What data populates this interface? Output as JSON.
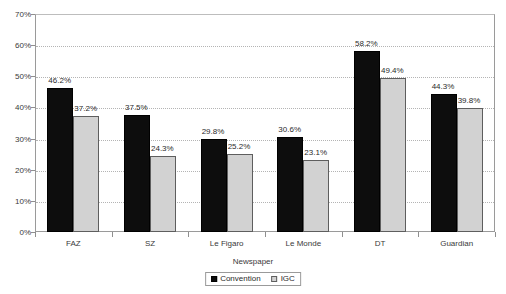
{
  "chart_data": {
    "type": "bar",
    "title": "",
    "xlabel": "Newspaper",
    "ylabel": "",
    "categories": [
      "FAZ",
      "SZ",
      "Le Figaro",
      "Le Monde",
      "DT",
      "Guardian"
    ],
    "series": [
      {
        "name": "Convention",
        "color": "#0d0d0d",
        "values": [
          46.2,
          37.5,
          29.8,
          30.6,
          58.2,
          44.3
        ],
        "labels": [
          "46.2%",
          "37.5%",
          "29.8%",
          "30.6%",
          "58.2%",
          "44.3%"
        ]
      },
      {
        "name": "IGC",
        "color": "#d2d2d2",
        "values": [
          37.2,
          24.3,
          25.2,
          23.1,
          49.4,
          39.8
        ],
        "labels": [
          "37.2%",
          "24.3%",
          "25.2%",
          "23.1%",
          "49.4%",
          "39.8%"
        ]
      }
    ],
    "ylim": [
      0,
      70
    ],
    "ytick_values": [
      0,
      10,
      20,
      30,
      40,
      50,
      60,
      70
    ],
    "ytick_labels": [
      "0%",
      "10%",
      "20%",
      "30%",
      "40%",
      "50%",
      "60%",
      "70%"
    ],
    "grid": true,
    "grid_axis": "y",
    "legend_position": "bottom-center",
    "value_labels": true
  }
}
